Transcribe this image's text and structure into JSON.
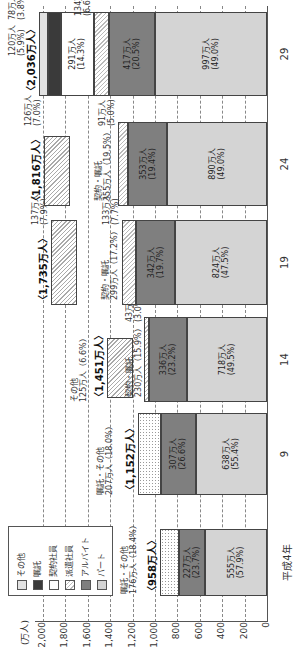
{
  "chart_data": {
    "type": "bar",
    "stacked": true,
    "orientation": "image rotated 90deg; vertical stacked bars",
    "title": "",
    "ylabel": "(万人)",
    "xlabel": "",
    "ylim": [
      0,
      2000
    ],
    "yticks": [
      "0",
      "200",
      "400",
      "600",
      "800",
      "1,000",
      "1,200",
      "1,400",
      "1,600",
      "1,800",
      "2,000"
    ],
    "grid": true,
    "legend_position": "top-left (inside plot)",
    "categories": [
      "平成4年",
      "9",
      "14",
      "19",
      "24",
      "29"
    ],
    "totals": [
      "〈958万人〉",
      "〈1,152万人〉",
      "〈1,451万人〉",
      "〈1,735万人〉",
      "〈1,816万人〉",
      "〈2,036万人〉"
    ],
    "legend": [
      "その他",
      "嘱託",
      "契約社員",
      "派遣社員",
      "アルバイト",
      "パート"
    ],
    "series": [
      {
        "name": "パート",
        "values": [
          555,
          638,
          718,
          824,
          890,
          997
        ],
        "labels": [
          "555万人(57.9%)",
          "638万人(55.4%)",
          "718万人(49.5%)",
          "824万人(47.5%)",
          "890万人(49.0%)",
          "997万人(49.0%)"
        ]
      },
      {
        "name": "アルバイト",
        "values": [
          227,
          307,
          336,
          342,
          353,
          417
        ],
        "labels": [
          "227万人(23.7%)",
          "307万人(26.6%)",
          "336万人(23.2%)",
          "342万人(19.7%)",
          "353万人(19.4%)",
          "417万人(20.5%)"
        ]
      },
      {
        "name": "派遣社員",
        "values": [
          null,
          null,
          43,
          133,
          91,
          134
        ],
        "labels": [
          "",
          "",
          "43万人(3.0%)",
          "133万人(7.7%)",
          "91万人(5.0%)",
          "134万人(6.6%)"
        ]
      },
      {
        "name": "契約社員",
        "values": [
          null,
          null,
          null,
          null,
          null,
          291
        ],
        "labels": [
          "",
          "",
          "",
          "",
          "",
          "291万人(14.3%)"
        ]
      },
      {
        "name": "嘱託",
        "values": [
          null,
          null,
          null,
          null,
          null,
          120
        ],
        "labels": [
          "",
          "",
          "",
          "",
          "",
          "120万人(5.9%)"
        ]
      },
      {
        "name": "その他",
        "values": [
          null,
          null,
          125,
          137,
          126,
          78
        ],
        "labels": [
          "",
          "",
          "125万人(6.6%)",
          "137万人(7.9%)",
          "126万人(7.0%)",
          "78万人(3.8%)"
        ]
      },
      {
        "name": "嘱託・その他",
        "values": [
          176,
          207,
          null,
          null,
          null,
          null
        ],
        "labels": [
          "176万人(18.4%)",
          "207万人(18.0%)",
          "",
          "",
          "",
          ""
        ]
      },
      {
        "name": "契約・嘱託",
        "values": [
          null,
          null,
          230,
          299,
          355,
          null
        ],
        "labels": [
          "",
          "",
          "230万人(15.9%)",
          "299万人(17.2%)",
          "355万人(19.5%)",
          ""
        ]
      }
    ]
  },
  "axis": {
    "unit": "(万人)",
    "ticks": [
      {
        "label": "0",
        "value": 0
      },
      {
        "label": "200",
        "value": 200
      },
      {
        "label": "400",
        "value": 400
      },
      {
        "label": "600",
        "value": 600
      },
      {
        "label": "800",
        "value": 800
      },
      {
        "label": "1,000",
        "value": 1000
      },
      {
        "label": "1,200",
        "value": 1200
      },
      {
        "label": "1,400",
        "value": 1400
      },
      {
        "label": "1,600",
        "value": 1600
      },
      {
        "label": "1,800",
        "value": 1800
      },
      {
        "label": "2,000",
        "value": 2000
      }
    ]
  },
  "legend": {
    "items": [
      {
        "label": "その他",
        "class": "c-sonota"
      },
      {
        "label": "嘱託",
        "class": "c-shokutaku"
      },
      {
        "label": "契約社員",
        "class": "c-keiyaku"
      },
      {
        "label": "派遣社員",
        "class": "c-haken"
      },
      {
        "label": "アルバイト",
        "class": "c-arubaito"
      },
      {
        "label": "パート",
        "class": "c-part"
      }
    ]
  },
  "bars": [
    {
      "category": "平成4年",
      "total": "〈958万人〉",
      "x": 56,
      "w": 67,
      "segments": [
        {
          "from": 0,
          "to": 555,
          "class": "c-part",
          "label1": "555万人",
          "label2": "(57.9%)"
        },
        {
          "from": 555,
          "to": 782,
          "class": "c-arubaito",
          "label1": "227万人",
          "label2": "(23.7%)"
        },
        {
          "from": 782,
          "to": 958,
          "class": "c-dots",
          "label1": "",
          "label2": ""
        }
      ],
      "annotations": [
        {
          "text1": "嘱託・その他",
          "text2": "176万人（18.4%）",
          "value": 1150,
          "dx": 2
        }
      ]
    },
    {
      "category": "9",
      "total": "〈1,152万人〉",
      "x": 157,
      "w": 82,
      "segments": [
        {
          "from": 0,
          "to": 638,
          "class": "c-part",
          "label1": "638万人",
          "label2": "(55.4%)"
        },
        {
          "from": 638,
          "to": 945,
          "class": "c-arubaito",
          "label1": "307万人",
          "label2": "(26.6%)"
        },
        {
          "from": 945,
          "to": 1152,
          "class": "c-dots",
          "label1": "",
          "label2": ""
        }
      ],
      "annotations": [
        {
          "text1": "嘱託・その他",
          "text2": "207万人（18.0%）",
          "value": 1370,
          "dx": 0
        }
      ]
    },
    {
      "category": "14",
      "total": "〈1,451万人〉",
      "x": 250,
      "w": 85,
      "segments": [
        {
          "from": 0,
          "to": 718,
          "class": "c-part",
          "label1": "718万人",
          "label2": "(49.5%)"
        },
        {
          "from": 718,
          "to": 1054,
          "class": "c-arubaito",
          "label1": "336万人",
          "label2": "(23.2%)"
        },
        {
          "from": 1054,
          "to": 1097,
          "class": "c-haken",
          "label1": "",
          "label2": ""
        }
      ],
      "offset_block": {
        "from": 1200,
        "to": 1425,
        "class": "c-mix",
        "x": 4,
        "w": 60
      },
      "annotations": [
        {
          "text1": "43万人",
          "text2": "(3.0%)",
          "value": 1110,
          "dx": 80
        },
        {
          "text1": "契約・嘱託",
          "text2": "230万人（15.9%）",
          "value": 1110,
          "dx": 5
        },
        {
          "text1": "その他",
          "text2": "125万人（6.6%）",
          "value": 1600,
          "dx": 0
        }
      ]
    },
    {
      "category": "19",
      "total": "〈1,735万人〉",
      "x": 347,
      "w": 85,
      "segments": [
        {
          "from": 0,
          "to": 824,
          "class": "c-part",
          "label1": "824万人",
          "label2": "(47.5%)"
        },
        {
          "from": 824,
          "to": 1166,
          "class": "c-arubaito",
          "label1": "342万人",
          "label2": "(19.7%)"
        },
        {
          "from": 1166,
          "to": 1299,
          "class": "c-haken",
          "label1": "",
          "label2": ""
        }
      ],
      "offset_block": {
        "from": 1700,
        "to": 1930,
        "class": "c-mix",
        "x": 0,
        "w": 85
      },
      "annotations": [
        {
          "text1": "133万人",
          "text2": "(7.7%)",
          "value": 1310,
          "dx": 80
        },
        {
          "text1": "契約・嘱託",
          "text2": "299万人（17.2%）",
          "value": 1320,
          "dx": 5
        },
        {
          "text1": "137万人",
          "text2": "(7.9%)",
          "value": 1950,
          "dx": 80
        }
      ]
    },
    {
      "category": "24",
      "total": "〈1,816万人〉",
      "x": 446,
      "w": 84,
      "segments": [
        {
          "from": 0,
          "to": 890,
          "class": "c-part",
          "label1": "890万人",
          "label2": "(49.0%)"
        },
        {
          "from": 890,
          "to": 1243,
          "class": "c-arubaito",
          "label1": "353万人",
          "label2": "(19.4%)"
        },
        {
          "from": 1243,
          "to": 1334,
          "class": "c-haken",
          "label1": "",
          "label2": ""
        }
      ],
      "offset_block": {
        "from": 1760,
        "to": 1990,
        "class": "c-mix",
        "x": 0,
        "w": 70
      },
      "annotations": [
        {
          "text1": "91万人",
          "text2": "(5.0%)",
          "value": 1350,
          "dx": 80
        },
        {
          "text1": "契約・嘱託",
          "text2": "355万人（19.5%）",
          "value": 1380,
          "dx": 5
        },
        {
          "text1": "126万人",
          "text2": "(7.0%)",
          "value": 2010,
          "dx": 80
        }
      ]
    },
    {
      "category": "29",
      "total": "〈2,036万人〉",
      "x": 556,
      "w": 84,
      "segments": [
        {
          "from": 0,
          "to": 997,
          "class": "c-part",
          "label1": "997万人",
          "label2": "(49.0%)"
        },
        {
          "from": 997,
          "to": 1414,
          "class": "c-arubaito",
          "label1": "417万人",
          "label2": "(20.5%)"
        },
        {
          "from": 1414,
          "to": 1548,
          "class": "c-haken",
          "label1": "",
          "label2": ""
        },
        {
          "from": 1548,
          "to": 1839,
          "class": "c-keiyaku",
          "label1": "291万人",
          "label2": "(14.3%)"
        },
        {
          "from": 1839,
          "to": 1959,
          "class": "c-shokutaku",
          "label1": "",
          "label2": ""
        },
        {
          "from": 1959,
          "to": 2036,
          "class": "c-sonota",
          "label1": "",
          "label2": ""
        }
      ],
      "annotations": [
        {
          "text1": "134万人",
          "text2": "(6.6%)",
          "value": 1560,
          "dx": 80
        },
        {
          "text1": "120万人",
          "text2": "(5.9%)",
          "value": 2150,
          "dx": 40
        },
        {
          "text1": "78万人",
          "text2": "(3.8%)",
          "value": 2150,
          "dx": 76
        }
      ]
    }
  ]
}
